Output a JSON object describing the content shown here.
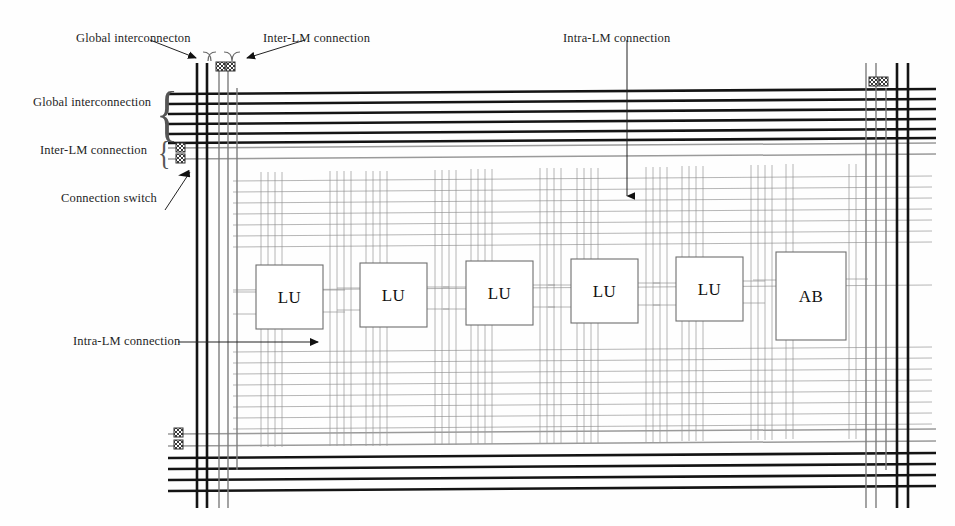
{
  "figure": {
    "type": "block-diagram"
  },
  "callouts": {
    "top_left": "Global interconnecton",
    "top_mid": "Inter-LM connection",
    "top_center": "Intra-LM connection",
    "left_global": "Global interconnection",
    "left_inter": "Inter-LM connection",
    "left_switch": "Connection switch",
    "left_intra": "Intra-LM connection"
  },
  "blocks": [
    {
      "label": "LU",
      "x": 256,
      "y": 265,
      "w": 67,
      "h": 64
    },
    {
      "label": "LU",
      "x": 360,
      "y": 263,
      "w": 67,
      "h": 64
    },
    {
      "label": "LU",
      "x": 466,
      "y": 261,
      "w": 67,
      "h": 64
    },
    {
      "label": "LU",
      "x": 571,
      "y": 259,
      "w": 67,
      "h": 64
    },
    {
      "label": "LU",
      "x": 676,
      "y": 257,
      "w": 67,
      "h": 64
    },
    {
      "label": "AB",
      "x": 776,
      "y": 252,
      "w": 70,
      "h": 88
    }
  ],
  "switches": [
    {
      "name": "top-left-switch-pair",
      "x": 218,
      "y": 66,
      "count": 2,
      "axis": "horizontal"
    },
    {
      "name": "top-right-switch-pair",
      "x": 872,
      "y": 81,
      "count": 2,
      "axis": "horizontal"
    },
    {
      "name": "left-switch-pair",
      "x": 180,
      "y": 147,
      "count": 2,
      "axis": "vertical"
    },
    {
      "name": "bottom-left-switch-pair",
      "x": 178,
      "y": 430,
      "count": 2,
      "axis": "vertical"
    }
  ],
  "buses": {
    "global_horizontal_top_count": 6,
    "inter_lm_horizontal_top_count": 2,
    "global_horizontal_bottom_count": 4,
    "inter_lm_horizontal_bottom_count": 2,
    "global_vertical_left_count": 3,
    "global_vertical_right_count": 3,
    "intra_lm_per_block": 4
  },
  "colors": {
    "global": "#141414",
    "inter_lm": "#9a9a9a",
    "intra_lm": "#8e8e8e",
    "block_stroke": "#6e6e6e",
    "text": "#1f1f1f",
    "arrow": "#111111"
  }
}
